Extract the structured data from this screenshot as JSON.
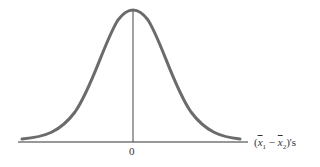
{
  "diagram": {
    "type": "normal-distribution-curve",
    "center_label": "0",
    "axis_label": {
      "prefix": "(",
      "var1": "x",
      "sub1": "1",
      "minus": " − ",
      "var2": "x",
      "sub2": "2",
      "suffix": ")'s"
    },
    "colors": {
      "curve": "#6b6b6b",
      "axis": "#333333",
      "center_line": "#444444"
    }
  }
}
